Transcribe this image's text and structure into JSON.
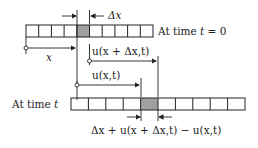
{
  "diagram": {
    "top_bar": {
      "label_prefix": "At time ",
      "label_var": "t",
      "label_suffix": " = 0",
      "cells": 10,
      "shaded_index": 4
    },
    "bottom_bar": {
      "label_prefix": "At time ",
      "label_var": "t",
      "cells": 10,
      "shaded_index": 4
    },
    "labels": {
      "delta_x": "Δx",
      "x": "x",
      "u_x_plus_dx": "u(x + Δx,t)",
      "u_x": "u(x,t)",
      "bottom_width": "Δx + u(x + Δx,t) − u(x,t)"
    },
    "colors": {
      "shade": "#a0a0a0",
      "line": "#222222"
    }
  }
}
